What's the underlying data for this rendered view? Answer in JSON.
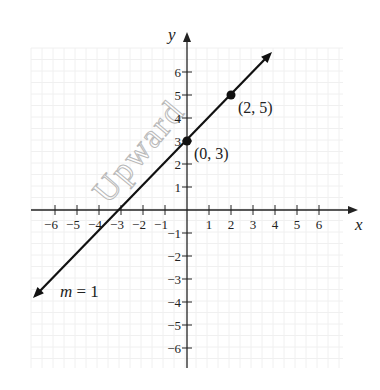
{
  "chart_data": {
    "type": "line",
    "title": "",
    "xlabel": "x",
    "ylabel": "y",
    "xlim": [
      -6.5,
      7.5
    ],
    "ylim": [
      -7,
      7.5
    ],
    "grid": true,
    "x_ticks": [
      -6,
      -5,
      -4,
      -3,
      -2,
      -1,
      1,
      2,
      3,
      4,
      5,
      6
    ],
    "y_ticks": [
      -6,
      -5,
      -4,
      -3,
      -2,
      -1,
      1,
      2,
      3,
      4,
      5,
      6
    ],
    "x_tick_labels": [
      "−6",
      "−5",
      "−4",
      "−3",
      "−2",
      "−1",
      "1",
      "2",
      "3",
      "4",
      "5",
      "6"
    ],
    "y_tick_labels": [
      "−6",
      "−5",
      "−4",
      "−3",
      "−2",
      "−1",
      "1",
      "2",
      "3",
      "4",
      "5",
      "6"
    ],
    "series": [
      {
        "name": "y = x + 3",
        "slope": 1,
        "intercept": 3,
        "x": [
          -7,
          4
        ],
        "y": [
          -4,
          7
        ],
        "arrows": "both"
      }
    ],
    "points": [
      {
        "x": 0,
        "y": 3,
        "label": "(0, 3)"
      },
      {
        "x": 2,
        "y": 5,
        "label": "(2, 5)"
      }
    ],
    "annotations": [
      {
        "text": "m = 1",
        "x": -5,
        "y": -3.5
      }
    ],
    "watermark": "Upward"
  }
}
